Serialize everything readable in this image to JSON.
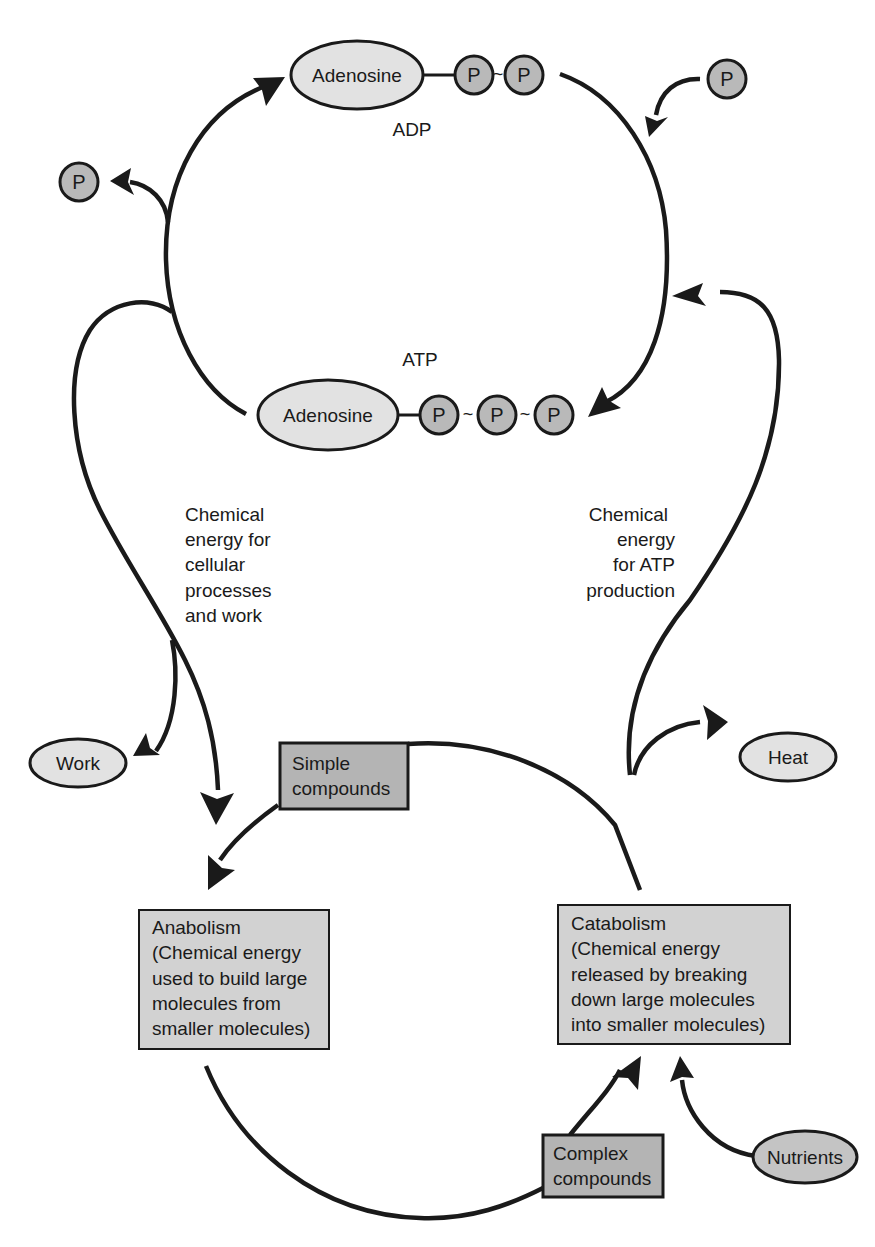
{
  "diagram": {
    "adp": {
      "label": "ADP",
      "nucleoside": "Adenosine",
      "phosphates": [
        "P",
        "P"
      ],
      "bond": "~"
    },
    "atp": {
      "label": "ATP",
      "nucleoside": "Adenosine",
      "phosphates": [
        "P",
        "P",
        "P"
      ],
      "bond": "~"
    },
    "free_phosphate_in": "P",
    "free_phosphate_out": "P",
    "energy_left": {
      "lines": [
        "Chemical",
        "energy for",
        "cellular",
        "processes",
        "and work"
      ]
    },
    "energy_right": {
      "lines": [
        "Chemical",
        "energy",
        "for ATP",
        "production"
      ]
    },
    "work": "Work",
    "heat": "Heat",
    "simple_compounds": [
      "Simple",
      "compounds"
    ],
    "complex_compounds": [
      "Complex",
      "compounds"
    ],
    "anabolism": {
      "lines": [
        "Anabolism",
        "(Chemical energy",
        "used to build large",
        "molecules from",
        "smaller molecules)"
      ]
    },
    "catabolism": {
      "lines": [
        "Catabolism",
        "(Chemical energy",
        "released by breaking",
        "down large molecules",
        "into smaller molecules)"
      ]
    },
    "nutrients": "Nutrients"
  },
  "colors": {
    "line": "#1a1a1a",
    "ellipse_fill": "#e2e2e2",
    "phosphate_fill": "#b9b9b9",
    "box_fill": "#d2d2d2",
    "compound_box_fill": "#b4b4b4"
  }
}
